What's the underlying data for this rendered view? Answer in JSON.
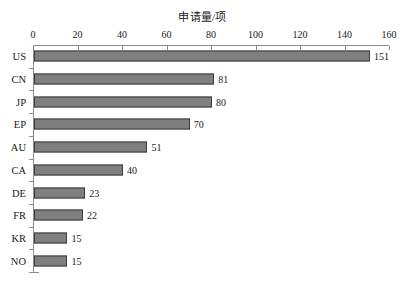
{
  "chart_data": {
    "type": "bar",
    "orientation": "horizontal",
    "title": "申请量/项",
    "xlabel": "",
    "ylabel": "",
    "categories": [
      "US",
      "CN",
      "JP",
      "EP",
      "AU",
      "CA",
      "DE",
      "FR",
      "KR",
      "NO"
    ],
    "values": [
      151,
      81,
      80,
      70,
      51,
      40,
      23,
      22,
      15,
      15
    ],
    "data_labels": [
      "151",
      "81",
      "80",
      "70",
      "51",
      "40",
      "23",
      "22",
      "15",
      "15"
    ],
    "xlim": [
      0,
      160
    ],
    "xticks": [
      0,
      20,
      40,
      60,
      80,
      100,
      120,
      140,
      160
    ],
    "xtick_labels": [
      "0",
      "20",
      "40",
      "60",
      "80",
      "100",
      "120",
      "140",
      "160"
    ],
    "grid": false,
    "legend": null,
    "series": [
      {
        "name": "申请量/项",
        "values": [
          151,
          81,
          80,
          70,
          51,
          40,
          23,
          22,
          15,
          15
        ]
      }
    ],
    "colors": {
      "bar_fill": "#7f7f7f",
      "bar_edge": "#3d3d3d",
      "axis": "#8c8c8c",
      "text": "#1a1a1a",
      "background": "#ffffff"
    }
  }
}
